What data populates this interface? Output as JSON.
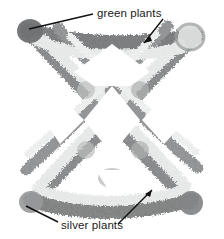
{
  "figure": {
    "type": "photograph-grayscale",
    "background_color": "#ffffff",
    "width": 224,
    "height": 239
  },
  "annotations": {
    "green": {
      "label": "green plants",
      "text_x": 97,
      "text_y": 7,
      "leader_color": "#111111",
      "leaders": [
        {
          "name": "green-leader-left",
          "x1": 93,
          "y1": 14,
          "x2": 29,
          "y2": 29
        },
        {
          "name": "green-leader-right",
          "x1": 163,
          "y1": 19,
          "x2": 144,
          "y2": 43
        }
      ]
    },
    "silver": {
      "label": "silver plants",
      "text_x": 61,
      "text_y": 219,
      "leader_color": "#111111",
      "leaders": [
        {
          "name": "silver-leader-left",
          "x1": 58,
          "y1": 222,
          "x2": 26,
          "y2": 206
        },
        {
          "name": "silver-leader-right",
          "x1": 118,
          "y1": 224,
          "x2": 152,
          "y2": 190
        }
      ]
    }
  },
  "plant_rows": {
    "dark_band_color": "#8f9090",
    "light_band_color": "#e8e9e9",
    "corner_blob_dark": "#6e7072",
    "corner_blob_light": "#d8dada",
    "dark_row_count": 4,
    "light_row_count": 4
  },
  "colors": {
    "text": "#1a1a1a",
    "background": "#ffffff",
    "leader_line": "#111111"
  }
}
